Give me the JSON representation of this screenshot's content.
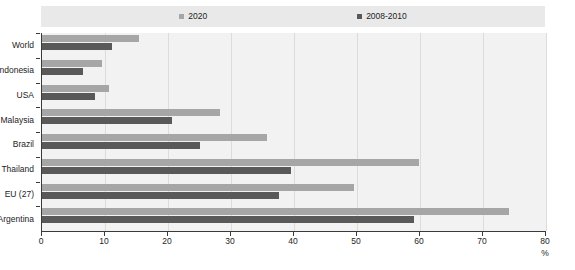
{
  "legend": {
    "position": "top-center",
    "entries": [
      {
        "label": "2020",
        "color": "#a6a6a6",
        "swatch_icon": "square-marker-icon"
      },
      {
        "label": "2008-2010",
        "color": "#595959",
        "swatch_icon": "square-marker-icon"
      }
    ]
  },
  "axis": {
    "x_unit": "%",
    "x_ticks": [
      "0",
      "10",
      "20",
      "30",
      "40",
      "50",
      "60",
      "70",
      "80"
    ]
  },
  "chart_data": {
    "type": "bar",
    "orientation": "horizontal",
    "title": "",
    "subtitle": "",
    "xlabel": "%",
    "ylabel": "",
    "xlim": [
      0,
      80
    ],
    "xticks": [
      0,
      10,
      20,
      30,
      40,
      50,
      60,
      70,
      80
    ],
    "grid": true,
    "legend_position": "top-center",
    "categories": [
      "World",
      "Indonesia",
      "USA",
      "Malaysia",
      "Brazil",
      "Thailand",
      "EU (27)",
      "Argentina"
    ],
    "series": [
      {
        "name": "2020",
        "color": "#a6a6a6",
        "values": [
          15.4,
          9.5,
          10.6,
          28.3,
          35.7,
          59.8,
          49.5,
          74.1
        ]
      },
      {
        "name": "2008-2010",
        "color": "#595959",
        "values": [
          11.1,
          6.5,
          8.4,
          20.6,
          25.1,
          39.5,
          37.6,
          59.0
        ]
      }
    ]
  }
}
